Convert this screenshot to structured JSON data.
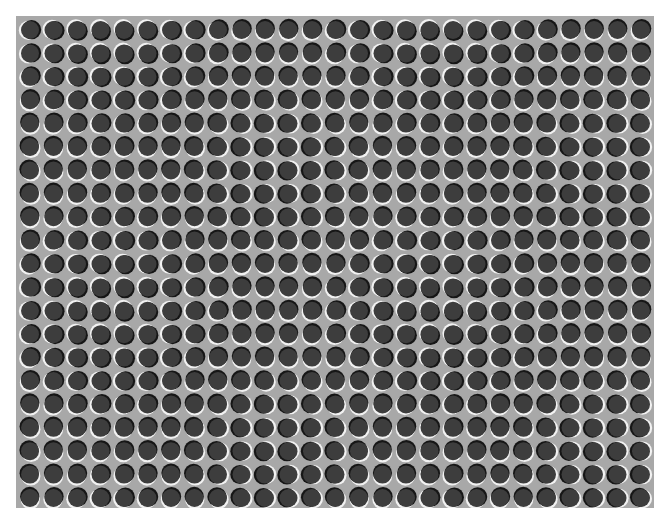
{
  "image": {
    "kind": "optical-illusion",
    "description": "Grid of dark circles with light/dark edge highlights (illusory motion pattern)",
    "frame": {
      "x": 16,
      "y": 16,
      "width": 638,
      "height": 492
    },
    "grid": {
      "columns": 27,
      "rows": 21,
      "origin_x": 14,
      "origin_y": 14,
      "spacing_x": 23.5,
      "spacing_y": 23.4,
      "radius": 9.6
    },
    "colors": {
      "background": "#a8a8a8",
      "circle_fill": "#3d3d3d",
      "dark_edge": "#161616",
      "light_edge": "#f2f2f2"
    },
    "highlight_field": {
      "base_angle_deg": 110,
      "col_wave_amp": 70,
      "row_wave_amp": 60,
      "col_period": 14,
      "row_period": 12
    }
  }
}
